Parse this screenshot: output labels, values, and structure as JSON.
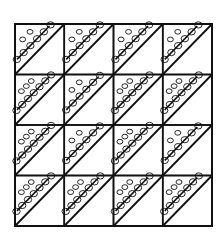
{
  "figure": {
    "title": "",
    "rows": 4,
    "cols": 4,
    "ink_color": "#111111",
    "background_color": "#ffffff",
    "cell_motif": "diagonal-band-with-loops",
    "loops_per_band": [
      [
        6,
        6,
        6,
        6
      ],
      [
        7,
        6,
        7,
        7
      ],
      [
        7,
        6,
        7,
        6
      ],
      [
        7,
        7,
        7,
        7
      ]
    ]
  }
}
